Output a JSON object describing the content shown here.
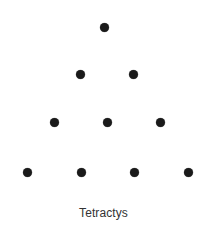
{
  "figure": {
    "name": "Tetractys",
    "caption": "Tetractys",
    "caption_color": "#333333",
    "caption_font_size_px": 12,
    "caption_center_x": 104,
    "caption_top_y": 206,
    "background_color": "#ffffff",
    "width_px": 207,
    "height_px": 238,
    "dot_color": "#1a1a1a",
    "dot_diameter_px": 9,
    "total_dots": 10,
    "row_count": 4,
    "horizontal_spacing_px": 53.5,
    "vertical_spacing_px": 48.3
  },
  "chart_data": {
    "type": "scatter",
    "title": "Tetractys",
    "xlabel": "",
    "ylabel": "",
    "xlim": [
      0,
      207
    ],
    "ylim": [
      238,
      0
    ],
    "grid": false,
    "legend": "none",
    "marker": "circle",
    "marker_color": "#1a1a1a",
    "marker_size_px": 9,
    "annotations": [
      "Tetractys"
    ],
    "rows": [
      {
        "row": 1,
        "count": 1,
        "y": 27,
        "x": [
          104
        ]
      },
      {
        "row": 2,
        "count": 2,
        "y": 74,
        "x": [
          80,
          133
        ]
      },
      {
        "row": 3,
        "count": 3,
        "y": 122,
        "x": [
          54,
          107,
          160
        ]
      },
      {
        "row": 4,
        "count": 4,
        "y": 172,
        "x": [
          27,
          81,
          134,
          188
        ]
      }
    ],
    "points": [
      {
        "id": "r1c1",
        "x": 104,
        "y": 27
      },
      {
        "id": "r2c1",
        "x": 80,
        "y": 74
      },
      {
        "id": "r2c2",
        "x": 133,
        "y": 74
      },
      {
        "id": "r3c1",
        "x": 54,
        "y": 122
      },
      {
        "id": "r3c2",
        "x": 107,
        "y": 122
      },
      {
        "id": "r3c3",
        "x": 160,
        "y": 122
      },
      {
        "id": "r4c1",
        "x": 27,
        "y": 172
      },
      {
        "id": "r4c2",
        "x": 81,
        "y": 172
      },
      {
        "id": "r4c3",
        "x": 134,
        "y": 172
      },
      {
        "id": "r4c4",
        "x": 188,
        "y": 172
      }
    ]
  }
}
